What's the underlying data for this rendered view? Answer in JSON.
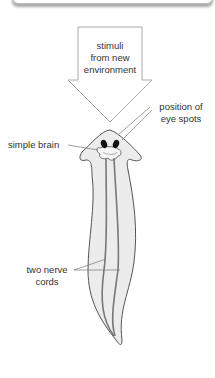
{
  "diagram": {
    "arrow_label": [
      "stimuli",
      "from new",
      "environment"
    ],
    "labels": {
      "eye_spots": [
        "position of",
        "eye spots"
      ],
      "brain": "simple brain",
      "nerve_cords": [
        "two nerve",
        "cords"
      ]
    },
    "colors": {
      "outline": "#555555",
      "body_fill": "#ececec",
      "nerve_cord": "#777777",
      "eye_spot": "#111111",
      "leader_line": "#777777",
      "arrow_outline": "#aaaaaa"
    }
  }
}
